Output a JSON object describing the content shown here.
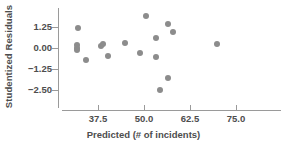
{
  "chart_data": {
    "type": "scatter",
    "title": "",
    "xlabel": "Predicted (# of incidents)",
    "ylabel": "Studentized Residuals",
    "xlim": [
      28.0,
      84.0
    ],
    "ylim": [
      -3.1,
      2.1
    ],
    "xticks": [
      37.5,
      50.0,
      62.5,
      75.0
    ],
    "xtick_labels": [
      "37.5",
      "50.0",
      "62.5",
      "75.0"
    ],
    "yticks": [
      1.25,
      0.0,
      -1.25,
      -2.5
    ],
    "ytick_labels": [
      "1.25",
      "0.00",
      "−1.25",
      "−2.50"
    ],
    "grid": false,
    "legend": null,
    "marker_color": "#8c8c8c",
    "axis_color": "#9a9a9a",
    "points": [
      {
        "x": 32.0,
        "y": 1.18
      },
      {
        "x": 31.8,
        "y": 0.18
      },
      {
        "x": 31.8,
        "y": 0.02
      },
      {
        "x": 31.9,
        "y": -0.12
      },
      {
        "x": 34.2,
        "y": -0.7
      },
      {
        "x": 38.4,
        "y": 0.1
      },
      {
        "x": 38.8,
        "y": 0.22
      },
      {
        "x": 40.3,
        "y": -0.48
      },
      {
        "x": 44.8,
        "y": 0.28
      },
      {
        "x": 48.8,
        "y": -0.3
      },
      {
        "x": 50.6,
        "y": 1.88
      },
      {
        "x": 53.3,
        "y": 0.62
      },
      {
        "x": 53.3,
        "y": -0.55
      },
      {
        "x": 54.4,
        "y": -2.48
      },
      {
        "x": 56.6,
        "y": 1.45
      },
      {
        "x": 56.6,
        "y": -1.8
      },
      {
        "x": 57.8,
        "y": 0.95
      },
      {
        "x": 69.8,
        "y": 0.22
      }
    ]
  },
  "axes": {
    "y_title": "Studentized Residuals",
    "x_title": "Predicted (# of incidents)"
  }
}
